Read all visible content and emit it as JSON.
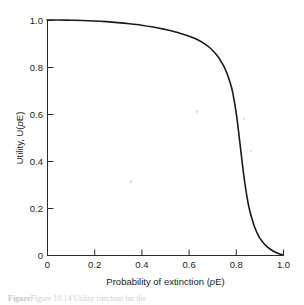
{
  "figure": {
    "caption_prefix": "Figure",
    "caption_text": "Figure 10.14  Utility function for the",
    "caption_visible": "partially cut off at bottom edge"
  },
  "chart_data": {
    "type": "line",
    "title": "",
    "xlabel": "Probability of extinction (pE)",
    "xlabel_parts": {
      "pre": "Probability of extinction (",
      "italic": "p",
      "post": "E)"
    },
    "ylabel": "Utility, U(pE)",
    "ylabel_parts": {
      "pre": "Utility, U(",
      "italic": "p",
      "post": "E)"
    },
    "xlim": [
      0,
      1.0
    ],
    "ylim": [
      0,
      1.0
    ],
    "xticks": [
      0,
      0.2,
      0.4,
      0.6,
      0.8,
      1.0
    ],
    "xticklabels": [
      "0",
      "0.2",
      "0.4",
      "0.6",
      "0.8",
      "1.0"
    ],
    "yticks": [
      0,
      0.2,
      0.4,
      0.6,
      0.8,
      1.0
    ],
    "yticklabels": [
      "0",
      "0.2",
      "0.4",
      "0.6",
      "0.8",
      "1.0"
    ],
    "grid": false,
    "legend": false,
    "tick_direction": "in",
    "spines": [
      "left",
      "bottom"
    ],
    "line_color": "#1a1a1a",
    "line_width": 1.6,
    "series": [
      {
        "name": "Utility U(pE)",
        "x": [
          0.0,
          0.05,
          0.1,
          0.15,
          0.2,
          0.25,
          0.3,
          0.35,
          0.4,
          0.45,
          0.5,
          0.55,
          0.6,
          0.63,
          0.66,
          0.69,
          0.72,
          0.74,
          0.76,
          0.78,
          0.79,
          0.8,
          0.81,
          0.82,
          0.83,
          0.84,
          0.85,
          0.86,
          0.88,
          0.9,
          0.92,
          0.94,
          0.96,
          0.98,
          1.0
        ],
        "y": [
          1.0,
          1.0,
          0.999,
          0.998,
          0.996,
          0.993,
          0.989,
          0.984,
          0.978,
          0.97,
          0.96,
          0.948,
          0.932,
          0.92,
          0.904,
          0.882,
          0.85,
          0.82,
          0.78,
          0.72,
          0.675,
          0.615,
          0.54,
          0.455,
          0.37,
          0.295,
          0.232,
          0.185,
          0.118,
          0.075,
          0.048,
          0.029,
          0.016,
          0.006,
          0.0
        ]
      }
    ]
  },
  "plot_geometry": {
    "left_px": 47,
    "right_px": 283,
    "top_px": 20,
    "bottom_px": 255
  }
}
